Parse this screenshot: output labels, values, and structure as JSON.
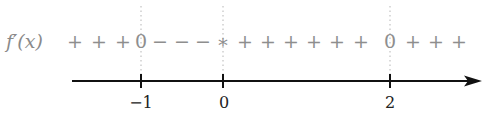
{
  "diagram": {
    "type": "sign-chart",
    "function_label": "f′(x)",
    "signs": [
      {
        "text": "+",
        "x": 75
      },
      {
        "text": "+",
        "x": 99
      },
      {
        "text": "+",
        "x": 123
      },
      {
        "text": "0",
        "x": 141
      },
      {
        "text": "−",
        "x": 159
      },
      {
        "text": "−",
        "x": 181
      },
      {
        "text": "−",
        "x": 203
      },
      {
        "text": "∗",
        "x": 223
      },
      {
        "text": "+",
        "x": 243
      },
      {
        "text": "+",
        "x": 267
      },
      {
        "text": "+",
        "x": 291
      },
      {
        "text": "+",
        "x": 315
      },
      {
        "text": "+",
        "x": 339
      },
      {
        "text": "+",
        "x": 363
      },
      {
        "text": "0",
        "x": 390
      },
      {
        "text": "+",
        "x": 413
      },
      {
        "text": "+",
        "x": 437
      },
      {
        "text": "+",
        "x": 461
      }
    ],
    "ticks": [
      {
        "label": "−1",
        "x": 141
      },
      {
        "label": "0",
        "x": 223
      },
      {
        "label": "2",
        "x": 390
      }
    ],
    "colors": {
      "axis": "#111111",
      "signs": "#8e8e8e",
      "dotted": "#b0b0b0"
    }
  }
}
